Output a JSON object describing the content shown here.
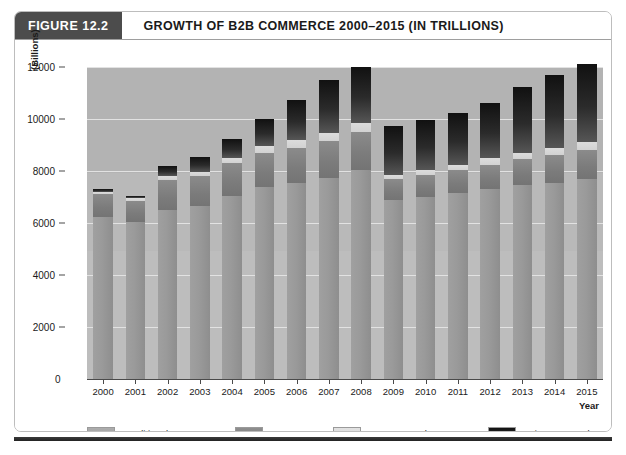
{
  "header": {
    "figure_tag": "FIGURE 12.2",
    "title": "GROWTH OF B2B COMMERCE 2000–2015 (IN TRILLIONS)"
  },
  "colors": {
    "traditional_b2b": "#9a9a9a",
    "edi": "#7b7b7b",
    "b2b_net_markets": "#d8d8d8",
    "private_networks": "#1a1a1a",
    "plot_background": "#b9b9b9",
    "gridline": "#e2e2e2",
    "tag_background": "#4c4c4c",
    "axis": "#4a4a4a"
  },
  "chart_data": {
    "type": "bar",
    "title": "GROWTH OF B2B COMMERCE 2000–2015 (IN TRILLIONS)",
    "subtitle": "",
    "stacked": true,
    "xlabel": "Year",
    "ylabel": "(Billions)",
    "ylim": [
      0,
      12000
    ],
    "ytick_step": 2000,
    "yticks": [
      0,
      2000,
      4000,
      6000,
      8000,
      10000,
      12000
    ],
    "ytick_labels": [
      "0",
      "2000",
      "4000",
      "6000",
      "8000",
      "10000",
      "12000"
    ],
    "grid": true,
    "legend_position": "bottom",
    "categories": [
      "2000",
      "2001",
      "2002",
      "2003",
      "2004",
      "2005",
      "2006",
      "2007",
      "2008",
      "2009",
      "2010",
      "2011",
      "2012",
      "2013",
      "2014",
      "2015"
    ],
    "series": [
      {
        "name": "Traditional B2B",
        "color": "#9a9a9a",
        "values": [
          6250,
          6050,
          6500,
          6650,
          7050,
          7400,
          7550,
          7750,
          8050,
          6900,
          7000,
          7150,
          7300,
          7450,
          7550,
          7700
        ]
      },
      {
        "name": "EDI",
        "color": "#7b7b7b",
        "values": [
          850,
          800,
          1150,
          1150,
          1250,
          1300,
          1350,
          1400,
          1450,
          800,
          850,
          900,
          950,
          1000,
          1050,
          1100
        ]
      },
      {
        "name": "B2B Net Markets",
        "color": "#d8d8d8",
        "values": [
          100,
          100,
          150,
          150,
          200,
          250,
          300,
          300,
          350,
          150,
          200,
          200,
          250,
          250,
          300,
          300
        ]
      },
      {
        "name": "Private Networks",
        "color": "#1a1a1a",
        "values": [
          100,
          100,
          400,
          600,
          750,
          1050,
          1550,
          2050,
          2150,
          1900,
          1900,
          2000,
          2100,
          2550,
          2800,
          3000
        ]
      }
    ],
    "totals": [
      7300,
      7050,
      8200,
      8550,
      9250,
      10000,
      10750,
      11500,
      12000,
      9750,
      9950,
      10250,
      10600,
      11250,
      11700,
      12100
    ]
  },
  "legend": {
    "items": [
      {
        "label": "Traditional B2B",
        "color": "#9a9a9a"
      },
      {
        "label": "EDI",
        "color": "#7b7b7b"
      },
      {
        "label": "B2B Net Markets",
        "color": "#d8d8d8"
      },
      {
        "label": "Private Networks",
        "color": "#1a1a1a"
      }
    ]
  }
}
